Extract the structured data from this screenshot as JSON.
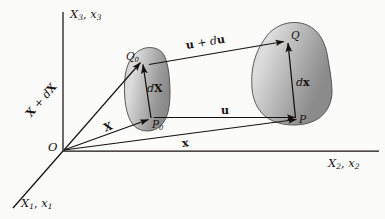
{
  "figure": {
    "kind": "continuum-mechanics-deformation-diagram",
    "background_color": "#fbfbfa",
    "ink_color": "#15110f",
    "body_fill_light": "#d9d9d9",
    "body_fill_dark": "#8e8e8e",
    "body_stroke": "#3a3a3a"
  },
  "axes": {
    "vertical": {
      "name": "X_3, x_3",
      "label_main": "X",
      "label_main_sub": "3",
      "label_alt": "x",
      "label_alt_sub": "3",
      "separator": ", "
    },
    "horizontal": {
      "name": "X_2, x_2",
      "label_main": "X",
      "label_main_sub": "2",
      "label_alt": "x",
      "label_alt_sub": "2",
      "separator": ", "
    },
    "diagonal": {
      "name": "X_1, x_1",
      "label_main": "X",
      "label_main_sub": "1",
      "label_alt": "x",
      "label_alt_sub": "1",
      "separator": ", "
    }
  },
  "origin": {
    "label": "O"
  },
  "points": {
    "P0": {
      "label": "P",
      "sub": "0"
    },
    "Q0": {
      "label": "Q",
      "sub": "0"
    },
    "P": {
      "label": "P",
      "sub": ""
    },
    "Q": {
      "label": "Q",
      "sub": ""
    }
  },
  "vectors": {
    "X": {
      "label": "X"
    },
    "X_plus_dX": {
      "label_a": "X",
      "op": " + ",
      "label_b": "d",
      "label_c": "X"
    },
    "x": {
      "label": "x"
    },
    "u": {
      "label": "u"
    },
    "u_plus_du": {
      "label_a": "u",
      "op": " + ",
      "label_b": "d",
      "label_c": "u"
    },
    "dX": {
      "prefix": "d",
      "label": "X"
    },
    "dx": {
      "prefix": "d",
      "label": "x"
    }
  }
}
